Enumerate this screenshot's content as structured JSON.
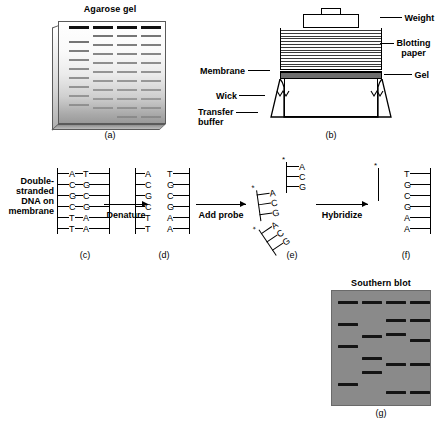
{
  "figure": {
    "panels": {
      "a": {
        "label": "(a)",
        "title": "Agarose gel",
        "lanes": [
          {
            "bands": [
              4,
              19,
              28,
              37,
              46,
              55,
              64,
              73,
              82
            ]
          },
          {
            "bands": [
              4,
              13,
              22,
              31,
              40,
              49,
              58,
              67,
              76,
              85
            ]
          },
          {
            "bands": [
              4,
              13,
              22,
              31,
              40,
              49,
              58,
              67,
              76,
              85,
              94
            ]
          },
          {
            "bands": [
              4,
              13,
              22,
              31,
              40,
              49,
              58,
              67,
              76,
              85,
              94
            ]
          }
        ]
      },
      "b": {
        "label": "(b)",
        "labels": {
          "weight": "Weight",
          "blotting_paper": "Blotting\npaper",
          "blotting_paper_line1": "Blotting",
          "blotting_paper_line2": "paper",
          "gel": "Gel",
          "membrane": "Membrane",
          "wick": "Wick",
          "transfer_buffer_line1": "Transfer",
          "transfer_buffer_line2": "buffer"
        }
      },
      "c": {
        "label": "(c)",
        "caption_lines": [
          "Double-",
          "stranded",
          "DNA on",
          "membrane"
        ],
        "left_strand": [
          "A",
          "C",
          "G",
          "C",
          "T",
          "T"
        ],
        "right_strand": [
          "T",
          "G",
          "C",
          "G",
          "A",
          "A"
        ],
        "paired": true
      },
      "d": {
        "label": "(d)",
        "left_strand": [
          "A",
          "C",
          "G",
          "C",
          "T",
          "T"
        ],
        "right_strand": [
          "T",
          "G",
          "C",
          "G",
          "A",
          "A"
        ],
        "paired": false
      },
      "e": {
        "label": "(e)",
        "probe_bases": [
          "A",
          "C",
          "G"
        ],
        "probe_marker": "*",
        "probe_count": 3
      },
      "f": {
        "label": "(f)",
        "probe_bases": [
          "A",
          "C",
          "G"
        ],
        "probe_marker": "*",
        "target_strand": [
          "T",
          "G",
          "C",
          "G",
          "A",
          "A"
        ]
      },
      "g": {
        "label": "(g)",
        "title": "Southern blot",
        "lanes": [
          {
            "bands": [
              10,
              32,
              54,
              92
            ]
          },
          {
            "bands": [
              10,
              44,
              66,
              80
            ]
          },
          {
            "bands": [
              10,
              28,
              42,
              72,
              100
            ]
          },
          {
            "bands": [
              10,
              28,
              48,
              72,
              100
            ]
          }
        ]
      }
    },
    "arrows": [
      {
        "name": "denature",
        "text": "Denature"
      },
      {
        "name": "add-probe",
        "text": "Add probe"
      },
      {
        "name": "hybridize",
        "text": "Hybridize"
      }
    ],
    "colors": {
      "band_dark": "#141414",
      "blot_background": "#8a8a8a",
      "gel_layer": "#6e6e6e"
    }
  }
}
